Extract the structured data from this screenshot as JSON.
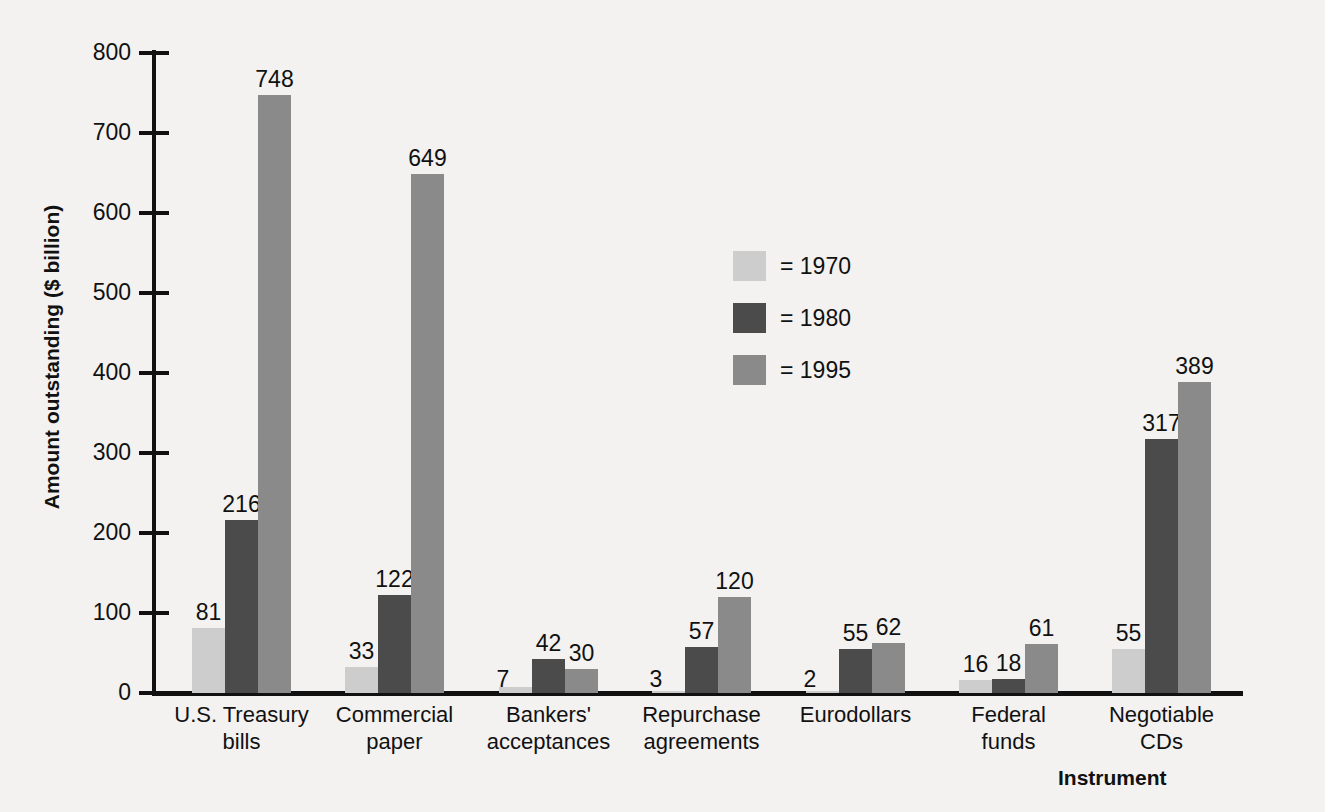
{
  "chart_data": {
    "type": "bar",
    "title": "",
    "xlabel": "Instrument",
    "ylabel": "Amount outstanding ($ billion)",
    "ylim": [
      0,
      800
    ],
    "yticks": [
      0,
      100,
      200,
      300,
      400,
      500,
      600,
      700,
      800
    ],
    "grid": false,
    "legend_position": "center",
    "categories": [
      "U.S. Treasury bills",
      "Commercial paper",
      "Bankers' acceptances",
      "Repurchase agreements",
      "Eurodollars",
      "Federal funds",
      "Negotiable CDs"
    ],
    "category_lines": [
      [
        "U.S. Treasury",
        "bills"
      ],
      [
        "Commercial",
        "paper"
      ],
      [
        "Bankers'",
        "acceptances"
      ],
      [
        "Repurchase",
        "agreements"
      ],
      [
        "Eurodollars",
        ""
      ],
      [
        "Federal",
        "funds"
      ],
      [
        "Negotiable",
        "CDs"
      ]
    ],
    "series": [
      {
        "name": "1970",
        "legend_label": "= 1970",
        "color": "#cdcdcd",
        "values": [
          81,
          33,
          7,
          3,
          2,
          16,
          55
        ]
      },
      {
        "name": "1980",
        "legend_label": "= 1980",
        "color": "#4b4b4b",
        "values": [
          216,
          122,
          42,
          57,
          55,
          18,
          317
        ]
      },
      {
        "name": "1995",
        "legend_label": "= 1995",
        "color": "#8a8a8a",
        "values": [
          748,
          649,
          30,
          120,
          62,
          61,
          389
        ]
      }
    ]
  },
  "colors": {
    "background": "#f3f2f0",
    "axis": "#111111",
    "text": "#111111",
    "series_1970": "#cdcdcd",
    "series_1980": "#4b4b4b",
    "series_1995": "#8a8a8a"
  }
}
